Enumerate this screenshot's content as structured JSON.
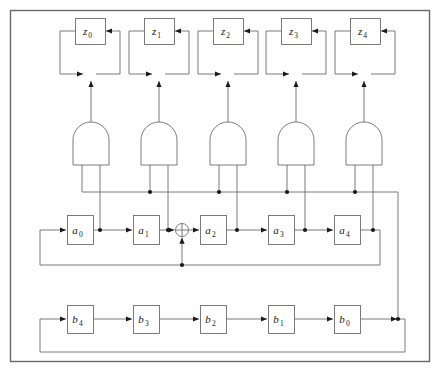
{
  "figure": {
    "type": "logic-circuit-diagram",
    "background_color": "#fefefe",
    "wire_color": "#6e6e6e",
    "dot_color": "#1a1a1a",
    "frame_color": "#6a6a6a"
  },
  "frame": {
    "x": 10,
    "y": 10,
    "width": 420,
    "height": 352
  },
  "registers": {
    "z": {
      "label_base": "z",
      "count": 5,
      "box_width": 30,
      "box_height": 26,
      "box_top": 18,
      "cells": [
        {
          "name": "z0",
          "base": "z",
          "subscript": "0",
          "cx": 90,
          "box_x": 75
        },
        {
          "name": "z1",
          "base": "z",
          "subscript": "1",
          "cx": 159,
          "box_x": 144
        },
        {
          "name": "z2",
          "base": "z",
          "subscript": "2",
          "cx": 228,
          "box_x": 213
        },
        {
          "name": "z3",
          "base": "z",
          "subscript": "3",
          "cx": 296,
          "box_x": 281
        },
        {
          "name": "z4",
          "base": "z",
          "subscript": "4",
          "cx": 365,
          "box_x": 350
        }
      ]
    },
    "a": {
      "label_base": "a",
      "count": 5,
      "box_width": 26,
      "box_height": 29,
      "box_top": 215,
      "row_y": 230,
      "feedback_y": 265,
      "cells": [
        {
          "name": "a0",
          "base": "a",
          "subscript": "0",
          "box_x": 67,
          "cx": 80
        },
        {
          "name": "a1",
          "base": "a",
          "subscript": "1",
          "box_x": 133,
          "cx": 146
        },
        {
          "name": "a2",
          "base": "a",
          "subscript": "2",
          "box_x": 200,
          "cx": 213
        },
        {
          "name": "a3",
          "base": "a",
          "subscript": "3",
          "box_x": 268,
          "cx": 281
        },
        {
          "name": "a4",
          "base": "a",
          "subscript": "4",
          "box_x": 334,
          "cx": 347
        }
      ]
    },
    "b": {
      "label_base": "b",
      "count": 5,
      "box_width": 26,
      "box_height": 28,
      "box_top": 305,
      "row_y": 319,
      "feedback_y": 352,
      "cells": [
        {
          "name": "b4",
          "base": "b",
          "subscript": "4",
          "box_x": 67,
          "cx": 80
        },
        {
          "name": "b3",
          "base": "b",
          "subscript": "3",
          "box_x": 133,
          "cx": 146
        },
        {
          "name": "b2",
          "base": "b",
          "subscript": "2",
          "box_x": 200,
          "cx": 213
        },
        {
          "name": "b1",
          "base": "b",
          "subscript": "1",
          "box_x": 268,
          "cx": 281
        },
        {
          "name": "b0",
          "base": "b",
          "subscript": "0",
          "box_x": 334,
          "cx": 347
        }
      ]
    }
  },
  "and_gates": {
    "count": 5,
    "name": "and-gate",
    "top_y": 122,
    "bottom_y": 165,
    "half_width": 18,
    "gates": [
      {
        "name": "and-gate-0",
        "cx": 91,
        "left_leg_x": 82,
        "right_leg_x": 100
      },
      {
        "name": "and-gate-1",
        "cx": 159,
        "left_leg_x": 150,
        "right_leg_x": 168
      },
      {
        "name": "and-gate-2",
        "cx": 228,
        "left_leg_x": 219,
        "right_leg_x": 237
      },
      {
        "name": "and-gate-3",
        "cx": 296,
        "left_leg_x": 287,
        "right_leg_x": 305
      },
      {
        "name": "and-gate-4",
        "cx": 364,
        "left_leg_x": 355,
        "right_leg_x": 373
      }
    ]
  },
  "xor_gates": {
    "accumulator_row": [
      {
        "name": "xor-z0",
        "cx": 90,
        "cy": 74,
        "r": 6
      },
      {
        "name": "xor-z1",
        "cx": 159,
        "cy": 74,
        "r": 6
      },
      {
        "name": "xor-z2",
        "cx": 228,
        "cy": 74,
        "r": 6
      },
      {
        "name": "xor-z3",
        "cx": 296,
        "cy": 74,
        "r": 6
      },
      {
        "name": "xor-z4",
        "cx": 365,
        "cy": 74,
        "r": 6
      }
    ],
    "a_row": [
      {
        "name": "xor-a-feedback",
        "cx": 182,
        "cy": 230,
        "r": 6.5
      }
    ]
  },
  "buses": {
    "and_input_bus": {
      "name": "and-gate-input-bus",
      "y": 192,
      "x_start": 82,
      "x_end": 398
    },
    "right_vertical_bus": {
      "name": "right-vertical-bus",
      "x": 398,
      "y_start": 192,
      "y_end": 319
    },
    "a_feedback_bus": {
      "name": "a-register-feedback-bus",
      "y": 265,
      "x_left": 40,
      "x_right": 380
    },
    "b_feedback_bus": {
      "name": "b-register-feedback-bus",
      "y": 352,
      "x_left": 40,
      "x_right": 405
    }
  },
  "junction_dots": [
    {
      "name": "dot-and-bus-1",
      "x": 150,
      "y": 192
    },
    {
      "name": "dot-and-bus-2",
      "x": 219,
      "y": 192
    },
    {
      "name": "dot-and-bus-3",
      "x": 287,
      "y": 192
    },
    {
      "name": "dot-and-bus-4",
      "x": 355,
      "y": 192
    },
    {
      "name": "dot-a0-tap",
      "x": 100,
      "y": 230
    },
    {
      "name": "dot-a1-tap",
      "x": 168,
      "y": 230
    },
    {
      "name": "dot-a2-tap",
      "x": 237,
      "y": 230
    },
    {
      "name": "dot-a3-tap",
      "x": 305,
      "y": 230
    },
    {
      "name": "dot-a4-tap",
      "x": 373,
      "y": 230
    },
    {
      "name": "dot-xor-a-feed",
      "x": 182,
      "y": 265
    },
    {
      "name": "dot-b-bus-right",
      "x": 398,
      "y": 319
    }
  ]
}
